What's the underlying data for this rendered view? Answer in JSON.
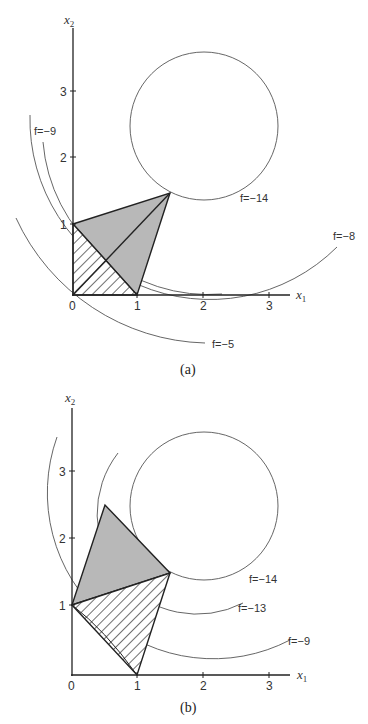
{
  "figure_a": {
    "caption": "(a)",
    "x_axis_label": "x",
    "x_axis_sub": "1",
    "y_axis_label": "x",
    "y_axis_sub": "2",
    "x_ticks": [
      "0",
      "1",
      "2",
      "3"
    ],
    "y_ticks": [
      "1",
      "2",
      "3"
    ],
    "contours": [
      {
        "label": "f=−9"
      },
      {
        "label": "f=−14"
      },
      {
        "label": "f=−8"
      },
      {
        "label": "f=−5"
      }
    ]
  },
  "figure_b": {
    "caption": "(b)",
    "x_axis_label": "x",
    "x_axis_sub": "1",
    "y_axis_label": "x",
    "y_axis_sub": "2",
    "x_ticks": [
      "0",
      "1",
      "2",
      "3"
    ],
    "y_ticks": [
      "1",
      "2",
      "3"
    ],
    "contours": [
      {
        "label": "f=−14"
      },
      {
        "label": "f=−13"
      },
      {
        "label": "f=−9"
      }
    ]
  },
  "colors": {
    "feasible_fill": "#b8b8b8",
    "line": "#222222"
  }
}
